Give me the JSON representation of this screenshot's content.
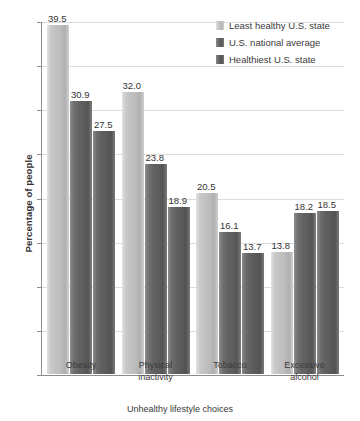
{
  "chart_data": {
    "type": "bar",
    "title": "",
    "subtitle": "",
    "xlabel": "Unhealthy lifestyle choices",
    "ylabel": "Percentage of people",
    "categories": [
      "Obesity",
      "Physical inactivity",
      "Tobacco",
      "Excessive alcohol"
    ],
    "series": [
      {
        "name": "Least healthy U.S. state",
        "color": "#c4c4c4",
        "values": [
          39.5,
          32.0,
          20.5,
          13.8
        ],
        "labels": [
          "39.5",
          "32.0",
          "20.5",
          "13.8"
        ]
      },
      {
        "name": "U.S. national average",
        "color": "#636363",
        "values": [
          30.9,
          23.8,
          16.1,
          18.2
        ],
        "labels": [
          "30.9",
          "23.8",
          "16.1",
          "18.2"
        ]
      },
      {
        "name": "Healthiest U.S. state",
        "color": "#5d5d5d",
        "values": [
          27.5,
          18.9,
          13.7,
          18.5
        ],
        "labels": [
          "27.5",
          "18.9",
          "13.7",
          "18.5"
        ]
      }
    ],
    "ylim": [
      0,
      40
    ],
    "yticks": [
      0,
      5,
      10,
      15,
      20,
      25,
      30,
      35,
      40
    ],
    "ytick_labels": [
      "0",
      "5",
      "10",
      "15",
      "20",
      "25",
      "30",
      "35",
      "40"
    ],
    "grid": true,
    "grid_axis": "y",
    "legend_position": "top-right",
    "data_labels": true
  },
  "category_lines": [
    [
      "Obesity"
    ],
    [
      "Physical",
      "inactivity"
    ],
    [
      "Tobacco"
    ],
    [
      "Excessive",
      "alcohol"
    ]
  ],
  "colors": {
    "gridline": "#dcdcdc",
    "axis": "#8d8d8d",
    "text": "#3a3a3a",
    "background": "#ffffff"
  }
}
